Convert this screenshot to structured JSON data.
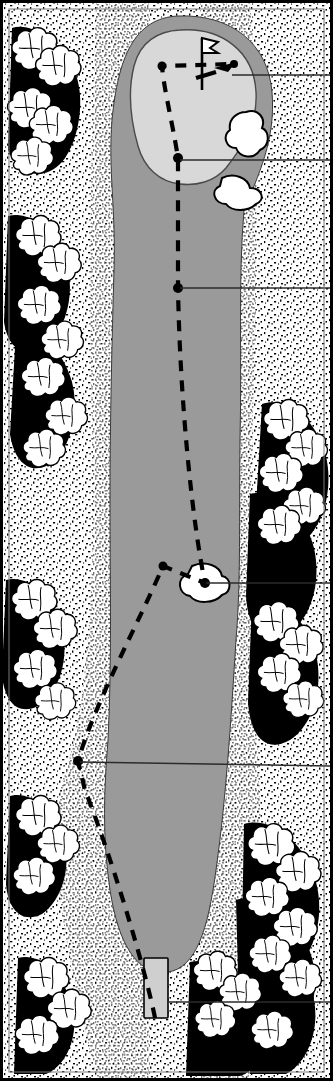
{
  "diagram": {
    "type": "golf-hole-layout",
    "title": "Golf hole plan view",
    "orientation": "green at top, tee at bottom",
    "frame": {
      "border_color": "#000000",
      "border_width_px": 2,
      "width_px": 333,
      "height_px": 1081
    }
  },
  "palette": {
    "fairway_green": "#9a9a9a",
    "putting_green": "#d8d8d8",
    "bunker_sand": "#ffffff",
    "rough_stipple": "#000000",
    "tree_canopy": "#ffffff",
    "tree_shadow": "#000000",
    "tee_box": "#cfcfcf",
    "play_line": "#000000",
    "leader_line": "#333333",
    "paper": "#ffffff"
  },
  "features": [
    {
      "id": "putting-green",
      "label": "Putting green",
      "shape": "irregular oval",
      "at_top": true
    },
    {
      "id": "flagstick",
      "label": "Flagstick / pin position",
      "x": 202,
      "y": 38
    },
    {
      "id": "greenside-bunker-upper",
      "label": "Greenside bunker (upper right)"
    },
    {
      "id": "greenside-bunker-lower",
      "label": "Greenside bunker (lower right)"
    },
    {
      "id": "fairway",
      "label": "Fairway"
    },
    {
      "id": "fairway-bunker",
      "label": "Fairway bunker",
      "x": 200,
      "y": 583
    },
    {
      "id": "rough",
      "label": "Rough (stippled)"
    },
    {
      "id": "trees-left",
      "label": "Tree line, left side"
    },
    {
      "id": "trees-right",
      "label": "Tree line, right side"
    },
    {
      "id": "tee-box",
      "label": "Teeing ground",
      "x": 155,
      "y": 960
    }
  ],
  "play_line": {
    "style": "dashed",
    "description": "Suggested line of play from tee to pin",
    "waypoints": [
      {
        "id": "wp-approach-left",
        "x": 162,
        "y": 66,
        "labeled": false
      },
      {
        "id": "wp-pin-approach",
        "x": 234,
        "y": 64,
        "labeled": false
      },
      {
        "id": "wp-green-front",
        "x": 178,
        "y": 158,
        "labeled": true
      },
      {
        "id": "wp-layup",
        "x": 178,
        "y": 288,
        "labeled": true
      },
      {
        "id": "wp-fairway-left",
        "x": 163,
        "y": 566,
        "labeled": false
      },
      {
        "id": "wp-bunker-carry",
        "x": 205,
        "y": 583,
        "labeled": true
      },
      {
        "id": "wp-dogleg",
        "x": 78,
        "y": 761,
        "labeled": true
      },
      {
        "id": "wp-tee",
        "x": 155,
        "y": 965,
        "labeled": true
      }
    ]
  },
  "callouts": [
    {
      "id": "callout-pin",
      "points_to": "flagstick",
      "anchor_x": 232,
      "anchor_y": 75,
      "exits_right": true,
      "text": ""
    },
    {
      "id": "callout-green-front",
      "points_to": "wp-green-front",
      "anchor_x": 180,
      "anchor_y": 160,
      "exits_right": true,
      "text": ""
    },
    {
      "id": "callout-layup",
      "points_to": "wp-layup",
      "anchor_x": 180,
      "anchor_y": 288,
      "exits_right": true,
      "text": ""
    },
    {
      "id": "callout-fairway-bunker",
      "points_to": "fairway-bunker",
      "anchor_x": 206,
      "anchor_y": 583,
      "exits_right": true,
      "text": ""
    },
    {
      "id": "callout-dogleg",
      "points_to": "wp-dogleg",
      "anchor_x": 80,
      "anchor_y": 762,
      "exits_right": true,
      "text": ""
    },
    {
      "id": "callout-tee",
      "points_to": "tee-box",
      "anchor_x": 168,
      "anchor_y": 1002,
      "exits_right": true,
      "text": ""
    }
  ]
}
